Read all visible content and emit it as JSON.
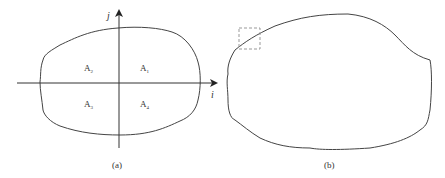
{
  "panels": [
    {
      "id": "a",
      "caption": "(a)",
      "axes": {
        "x_label": "i",
        "y_label": "j"
      },
      "quadrants": [
        {
          "base": "A",
          "sub": "1"
        },
        {
          "base": "A",
          "sub": "2"
        },
        {
          "base": "A",
          "sub": "3"
        },
        {
          "base": "A",
          "sub": "4"
        }
      ]
    },
    {
      "id": "b",
      "caption": "(b)",
      "highlight": "dashed-box"
    }
  ],
  "colors": {
    "stroke": "#444444",
    "dashed": "#999999",
    "text": "#333333"
  }
}
